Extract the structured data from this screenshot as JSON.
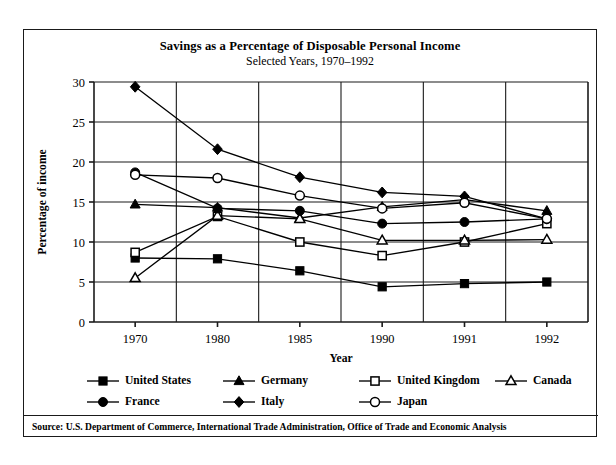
{
  "figure": {
    "title": "Savings as a Percentage of Disposable Personal Income",
    "subtitle": "Selected Years, 1970–1992",
    "source": "Source: U.S. Department of Commerce, International Trade Administration, Office of Trade and Economic Analysis"
  },
  "chart_data": {
    "type": "line",
    "title": "Savings as a Percentage of Disposable Personal Income",
    "subtitle": "Selected Years, 1970–1992",
    "xlabel": "Year",
    "ylabel": "Percentage of income",
    "categories": [
      "1970",
      "1980",
      "1985",
      "1990",
      "1991",
      "1992"
    ],
    "ylim": [
      0,
      30
    ],
    "yticks": [
      0,
      5,
      10,
      15,
      20,
      25,
      30
    ],
    "grid": true,
    "legend_position": "below-plot",
    "series": [
      {
        "name": "United States",
        "marker": "filled-square",
        "values": [
          8.0,
          7.9,
          6.4,
          4.4,
          4.8,
          5.0
        ]
      },
      {
        "name": "Germany",
        "marker": "filled-triangle",
        "values": [
          14.7,
          14.3,
          13.0,
          14.4,
          15.3,
          13.9
        ]
      },
      {
        "name": "United Kingdom",
        "marker": "open-square",
        "values": [
          8.7,
          13.2,
          10.0,
          8.3,
          10.0,
          12.3
        ]
      },
      {
        "name": "Canada",
        "marker": "open-triangle",
        "values": [
          5.5,
          13.3,
          12.9,
          10.2,
          10.2,
          10.3
        ]
      },
      {
        "name": "France",
        "marker": "filled-circle",
        "values": [
          18.7,
          14.2,
          13.9,
          12.3,
          12.5,
          12.9
        ]
      },
      {
        "name": "Italy",
        "marker": "filled-diamond",
        "values": [
          29.4,
          21.6,
          18.1,
          16.2,
          15.7,
          12.9
        ]
      },
      {
        "name": "Japan",
        "marker": "open-circle",
        "values": [
          18.4,
          18.0,
          15.8,
          14.2,
          14.9,
          12.9
        ]
      }
    ]
  },
  "legend": {
    "row1": [
      {
        "label": "United States",
        "marker": "filled-square"
      },
      {
        "label": "Germany",
        "marker": "filled-triangle"
      },
      {
        "label": "United Kingdom",
        "marker": "open-square"
      },
      {
        "label": "Canada",
        "marker": "open-triangle"
      }
    ],
    "row2": [
      {
        "label": "France",
        "marker": "filled-circle"
      },
      {
        "label": "Italy",
        "marker": "filled-diamond"
      },
      {
        "label": "Japan",
        "marker": "open-circle"
      }
    ]
  }
}
